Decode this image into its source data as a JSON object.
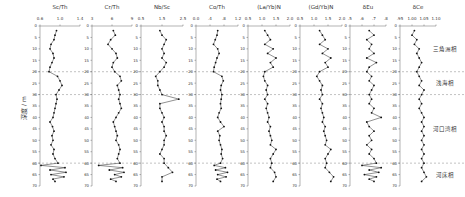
{
  "figure": {
    "ylabel": "深度 / m",
    "depth_range": [
      0,
      70
    ],
    "depth_ticks": [
      0,
      5,
      10,
      15,
      20,
      25,
      30,
      35,
      40,
      45,
      50,
      55,
      60,
      65,
      70
    ],
    "boundaries": [
      20,
      30,
      60
    ],
    "facies": [
      {
        "label": "三角洲相",
        "depth": 10
      },
      {
        "label": "浅海相",
        "depth": 25
      },
      {
        "label": "河口湾相",
        "depth": 45
      },
      {
        "label": "河床相",
        "depth": 65
      }
    ]
  },
  "chart_data": [
    {
      "type": "line",
      "title": "Sc/Th",
      "xlim": [
        0.6,
        1.4
      ],
      "xticks": [
        "0.6",
        "1.0",
        "1.4"
      ],
      "ylabel": "深度 / m",
      "ylim": [
        0,
        70
      ],
      "series": [
        {
          "name": "Sc/Th",
          "depth": [
            2,
            4,
            6,
            8,
            10,
            12,
            14,
            16,
            18,
            20,
            22,
            24,
            26,
            28,
            30,
            32,
            34,
            36,
            38,
            40,
            42,
            44,
            46,
            48,
            50,
            52,
            54,
            56,
            58,
            60,
            61,
            62,
            63,
            64,
            65,
            66,
            67,
            68
          ],
          "values": [
            0.93,
            0.9,
            0.88,
            0.82,
            0.8,
            0.86,
            0.88,
            0.84,
            0.8,
            0.78,
            0.95,
            1.0,
            1.04,
            0.98,
            0.92,
            0.94,
            0.92,
            0.9,
            0.88,
            0.86,
            0.8,
            0.85,
            0.88,
            0.84,
            0.86,
            0.82,
            0.88,
            0.86,
            0.9,
            0.96,
            0.62,
            1.1,
            0.8,
            1.12,
            0.82,
            1.08,
            0.86,
            0.9
          ]
        }
      ]
    },
    {
      "type": "line",
      "title": "Cr/Th",
      "xlim": [
        3,
        9
      ],
      "xticks": [
        "3",
        "6",
        "9"
      ],
      "ylim": [
        0,
        70
      ],
      "series": [
        {
          "name": "Cr/Th",
          "depth": [
            2,
            4,
            6,
            8,
            10,
            12,
            14,
            16,
            18,
            20,
            22,
            24,
            26,
            28,
            30,
            32,
            34,
            36,
            38,
            40,
            42,
            44,
            46,
            48,
            50,
            52,
            54,
            56,
            58,
            60,
            61,
            62,
            63,
            64,
            65,
            66,
            67,
            68
          ],
          "values": [
            6.2,
            6.5,
            5.8,
            5.4,
            6.0,
            6.6,
            6.8,
            6.2,
            6.0,
            6.4,
            7.2,
            7.4,
            6.8,
            7.0,
            7.2,
            7.0,
            7.2,
            7.4,
            7.0,
            6.6,
            6.2,
            6.4,
            6.6,
            6.8,
            6.6,
            7.0,
            7.2,
            7.0,
            6.8,
            7.2,
            4.0,
            7.6,
            5.6,
            7.8,
            6.4,
            7.4,
            5.8,
            6.6
          ]
        }
      ]
    },
    {
      "type": "line",
      "title": "Nb/Sc",
      "xlim": [
        0.5,
        2.5
      ],
      "xticks": [
        "0.5",
        "1.5",
        "2.5"
      ],
      "ylim": [
        0,
        70
      ],
      "series": [
        {
          "name": "Nb/Sc",
          "depth": [
            2,
            4,
            6,
            8,
            10,
            12,
            14,
            16,
            18,
            20,
            22,
            24,
            26,
            28,
            30,
            32,
            34,
            36,
            38,
            40,
            42,
            44,
            46,
            48,
            50,
            52,
            54,
            56,
            58,
            60,
            62,
            64,
            66,
            68
          ],
          "values": [
            1.4,
            1.5,
            1.7,
            1.6,
            1.5,
            1.6,
            1.5,
            1.7,
            1.6,
            1.4,
            1.2,
            1.3,
            1.3,
            1.4,
            1.5,
            2.3,
            1.4,
            1.4,
            1.5,
            1.6,
            1.5,
            1.6,
            1.6,
            1.7,
            1.6,
            1.6,
            1.5,
            1.4,
            1.6,
            1.6,
            1.8,
            2.0,
            1.5,
            1.5
          ]
        }
      ]
    },
    {
      "type": "line",
      "title": "Co/Th",
      "xlim": [
        0.0,
        1.2
      ],
      "xticks": [
        "0.0",
        ".4",
        ".8",
        "1.2"
      ],
      "ylim": [
        0,
        70
      ],
      "series": [
        {
          "name": "Co/Th",
          "depth": [
            2,
            4,
            6,
            8,
            10,
            12,
            14,
            16,
            18,
            20,
            22,
            24,
            26,
            28,
            30,
            32,
            34,
            36,
            38,
            40,
            42,
            44,
            46,
            48,
            50,
            52,
            54,
            56,
            58,
            60,
            61,
            62,
            63,
            64,
            65,
            66,
            67,
            68
          ],
          "values": [
            0.62,
            0.6,
            0.55,
            0.5,
            0.62,
            0.66,
            0.6,
            0.56,
            0.52,
            0.5,
            0.74,
            0.78,
            0.72,
            0.7,
            0.74,
            0.72,
            0.7,
            0.72,
            0.66,
            0.62,
            0.7,
            0.8,
            0.62,
            0.68,
            0.66,
            0.7,
            0.74,
            0.72,
            0.76,
            0.7,
            0.52,
            0.84,
            0.56,
            0.9,
            0.62,
            0.86,
            0.6,
            0.7
          ]
        }
      ]
    },
    {
      "type": "line",
      "title": "(La/Yb)N",
      "xlim": [
        0.5,
        2.0
      ],
      "xticks": [
        "0.5",
        "1.0",
        "1.5",
        "2.0"
      ],
      "ylim": [
        0,
        70
      ],
      "series": [
        {
          "name": "(La/Yb)N",
          "depth": [
            2,
            4,
            6,
            8,
            10,
            12,
            14,
            16,
            18,
            20,
            22,
            24,
            26,
            28,
            30,
            32,
            34,
            36,
            38,
            40,
            42,
            44,
            46,
            48,
            50,
            52,
            54,
            56,
            58,
            60,
            62,
            64,
            66,
            68
          ],
          "values": [
            1.1,
            1.2,
            1.3,
            1.1,
            1.4,
            1.2,
            1.5,
            1.3,
            1.4,
            1.1,
            1.05,
            1.1,
            1.2,
            1.15,
            1.2,
            1.1,
            1.2,
            1.15,
            1.2,
            1.25,
            1.2,
            1.3,
            1.25,
            1.3,
            1.35,
            1.3,
            1.5,
            1.4,
            1.3,
            1.35,
            1.3,
            1.45,
            1.5,
            1.4
          ]
        }
      ]
    },
    {
      "type": "line",
      "title": "(Gd/Yb)N",
      "xlim": [
        0.5,
        2.0
      ],
      "xticks": [
        "0.5",
        "1.0",
        "1.5",
        "2.0"
      ],
      "ylim": [
        0,
        70
      ],
      "series": [
        {
          "name": "(Gd/Yb)N",
          "depth": [
            2,
            4,
            6,
            8,
            10,
            12,
            14,
            16,
            18,
            20,
            22,
            24,
            26,
            28,
            30,
            32,
            34,
            36,
            38,
            40,
            42,
            44,
            46,
            48,
            50,
            52,
            54,
            56,
            58,
            60,
            62,
            64,
            66,
            68
          ],
          "values": [
            1.2,
            1.3,
            1.4,
            1.2,
            1.5,
            1.3,
            1.6,
            1.4,
            1.5,
            1.2,
            1.1,
            1.2,
            1.3,
            1.25,
            1.3,
            1.2,
            1.3,
            1.25,
            1.3,
            1.35,
            1.3,
            1.4,
            1.35,
            1.4,
            1.45,
            1.4,
            1.6,
            1.5,
            1.4,
            1.45,
            1.4,
            1.55,
            1.7,
            1.6
          ]
        }
      ]
    },
    {
      "type": "line",
      "title": "δEu",
      "xlim": [
        0.5,
        0.8
      ],
      "xticks": [
        ".5",
        ".6",
        ".7",
        ".8"
      ],
      "ylim": [
        0,
        70
      ],
      "series": [
        {
          "name": "δEu",
          "depth": [
            2,
            4,
            6,
            8,
            10,
            12,
            14,
            16,
            18,
            20,
            22,
            24,
            26,
            28,
            30,
            32,
            34,
            36,
            38,
            40,
            42,
            44,
            46,
            48,
            50,
            52,
            54,
            56,
            58,
            60,
            61,
            62,
            63,
            64,
            65,
            66,
            67,
            68
          ],
          "values": [
            0.66,
            0.7,
            0.64,
            0.68,
            0.66,
            0.7,
            0.64,
            0.72,
            0.66,
            0.64,
            0.68,
            0.66,
            0.7,
            0.68,
            0.66,
            0.68,
            0.66,
            0.7,
            0.68,
            0.76,
            0.64,
            0.66,
            0.7,
            0.66,
            0.68,
            0.64,
            0.68,
            0.66,
            0.7,
            0.72,
            0.6,
            0.76,
            0.66,
            0.74,
            0.62,
            0.72,
            0.66,
            0.7
          ]
        }
      ]
    },
    {
      "type": "line",
      "title": "δCe",
      "xlim": [
        0.95,
        1.1
      ],
      "xticks": [
        ".95",
        "1.00",
        "1.05",
        "1.10"
      ],
      "ylim": [
        0,
        70
      ],
      "series": [
        {
          "name": "δCe",
          "depth": [
            2,
            4,
            6,
            8,
            10,
            12,
            14,
            16,
            18,
            20,
            22,
            24,
            26,
            28,
            30,
            32,
            34,
            36,
            38,
            40,
            42,
            44,
            46,
            48,
            50,
            52,
            54,
            56,
            58,
            60,
            62,
            64,
            66,
            68
          ],
          "values": [
            1.01,
            1.0,
            1.02,
            1.01,
            1.03,
            1.02,
            1.03,
            1.04,
            1.03,
            1.02,
            1.03,
            1.04,
            1.03,
            1.05,
            1.04,
            1.03,
            1.04,
            1.03,
            1.04,
            1.05,
            1.04,
            1.05,
            1.04,
            1.05,
            1.04,
            1.05,
            1.04,
            1.05,
            1.04,
            1.05,
            1.04,
            1.05,
            1.06,
            1.04
          ]
        }
      ]
    }
  ]
}
